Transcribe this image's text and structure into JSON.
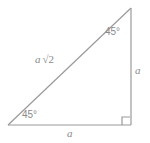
{
  "figure": {
    "type": "geometry-diagram",
    "shape": "right-triangle",
    "background_color": "#ffffff",
    "stroke_color": "#9a9a9a",
    "text_color": "#8a8a8a"
  },
  "labels": {
    "angle_top_right": "45°",
    "angle_bottom_left": "45°",
    "hypotenuse_variable": "a",
    "hypotenuse_radical": "√2",
    "leg_vertical": "a",
    "leg_horizontal": "a"
  },
  "geometry": {
    "vertices": {
      "bottom_left": [
        8,
        125
      ],
      "bottom_right": [
        131,
        125
      ],
      "top_right": [
        131,
        8
      ]
    },
    "right_angle_marker": {
      "corner": "bottom_right",
      "size": 8
    }
  }
}
